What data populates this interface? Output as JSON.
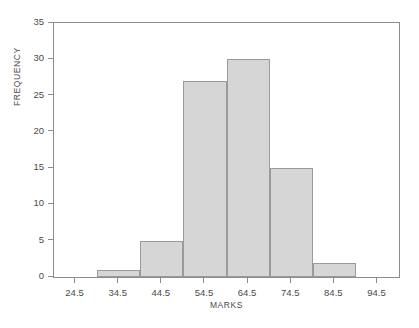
{
  "chart_data": {
    "type": "bar",
    "title": "",
    "subtitle": "",
    "xlabel": "MARKS",
    "ylabel": "FREQUENCY",
    "grid": false,
    "legend": null,
    "legend_position": "none",
    "xlim": [
      19.5,
      99.5
    ],
    "ylim": [
      0,
      35
    ],
    "x_tick_labels": [
      "24.5",
      "34.5",
      "44.5",
      "54.5",
      "64.5",
      "74.5",
      "84.5",
      "94.5"
    ],
    "x_tick_values": [
      24.5,
      34.5,
      44.5,
      54.5,
      64.5,
      74.5,
      84.5,
      94.5
    ],
    "y_tick_labels": [
      "0",
      "5",
      "10",
      "15",
      "20",
      "25",
      "30",
      "35"
    ],
    "y_tick_values": [
      0,
      5,
      10,
      15,
      20,
      25,
      30,
      35
    ],
    "bin_edges": [
      19.5,
      29.5,
      39.5,
      49.5,
      59.5,
      69.5,
      79.5,
      89.5,
      99.5
    ],
    "categories": [
      "19.5-29.5",
      "29.5-39.5",
      "39.5-49.5",
      "49.5-59.5",
      "59.5-69.5",
      "69.5-79.5",
      "79.5-89.5",
      "89.5-99.5"
    ],
    "values": [
      0,
      1,
      5,
      27,
      30,
      15,
      2,
      0
    ],
    "bar_fill_color": "#d6d6d6",
    "bar_border_color": "#9a9a9a",
    "axis_color": "#8c8c8c",
    "text_color": "#4a4a4a",
    "background_color": "#ffffff"
  },
  "figure": {
    "caption_fragment": ""
  }
}
